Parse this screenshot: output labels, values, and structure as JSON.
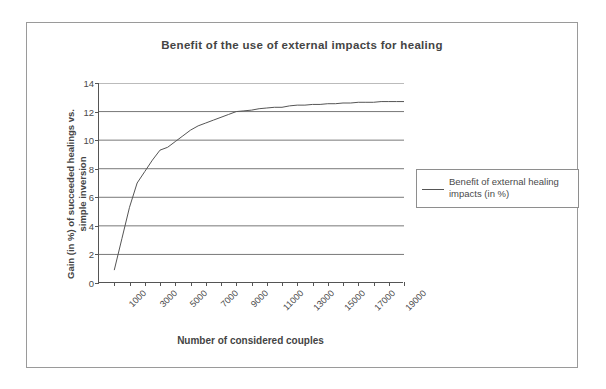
{
  "chart_data": {
    "type": "line",
    "title": "Benefit of the use of external impacts for healing",
    "xlabel": "Number of considered couples",
    "ylabel_line1": "Gain (in %) of succeeded healings vs.",
    "ylabel_line2": "simple inversion",
    "ylim": [
      0,
      14
    ],
    "xlim": [
      0,
      20000
    ],
    "grid": "horizontal",
    "legend_position": "right",
    "y_ticks": [
      "14",
      "12",
      "10",
      "8",
      "6",
      "4",
      "2",
      "0"
    ],
    "y_tick_values": [
      14,
      12,
      10,
      8,
      6,
      4,
      2,
      0
    ],
    "x_ticks": [
      "1000",
      "3000",
      "5000",
      "7000",
      "9000",
      "11000",
      "13000",
      "15000",
      "17000",
      "19000"
    ],
    "x_tick_values": [
      1000,
      3000,
      5000,
      7000,
      9000,
      11000,
      13000,
      15000,
      17000,
      19000
    ],
    "x_minor_tick_values": [
      1000,
      2000,
      3000,
      4000,
      5000,
      6000,
      7000,
      8000,
      9000,
      10000,
      11000,
      12000,
      13000,
      14000,
      15000,
      16000,
      17000,
      18000,
      19000,
      20000
    ],
    "series": [
      {
        "name": "Benefit of external healing impacts  (in %)",
        "color": "#555555",
        "x": [
          1000,
          1500,
          2000,
          2500,
          3000,
          3500,
          4000,
          4500,
          5000,
          5500,
          6000,
          6500,
          7000,
          7500,
          8000,
          8500,
          9000,
          9500,
          10000,
          10500,
          11000,
          11500,
          12000,
          12500,
          13000,
          13500,
          14000,
          14500,
          15000,
          15500,
          16000,
          16500,
          17000,
          17500,
          18000,
          18500,
          19000,
          19500,
          20000
        ],
        "values": [
          0.9,
          3.1,
          5.3,
          7.0,
          7.8,
          8.6,
          9.3,
          9.5,
          9.9,
          10.3,
          10.7,
          11.0,
          11.2,
          11.4,
          11.6,
          11.8,
          12.0,
          12.05,
          12.1,
          12.2,
          12.25,
          12.3,
          12.3,
          12.4,
          12.45,
          12.45,
          12.5,
          12.5,
          12.55,
          12.55,
          12.6,
          12.6,
          12.65,
          12.65,
          12.65,
          12.7,
          12.7,
          12.7,
          12.7
        ]
      }
    ]
  },
  "legend": {
    "entries": [
      {
        "label": "Benefit of external healing impacts  (in %)"
      }
    ]
  }
}
